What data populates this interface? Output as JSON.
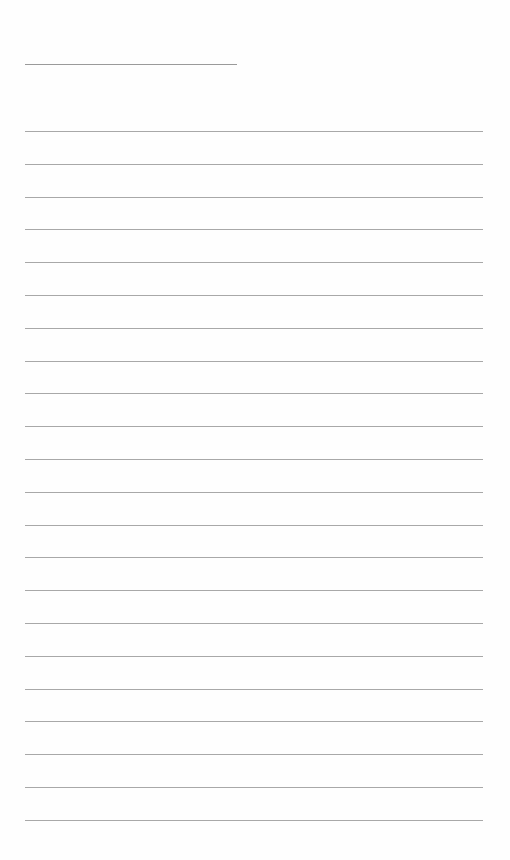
{
  "document": {
    "type": "lined-paper",
    "title_line": {
      "present": true,
      "text": ""
    },
    "ruled_lines": {
      "count": 22,
      "start_y": 131,
      "spacing": 32.8,
      "left": 25,
      "right": 483,
      "color": "#a8a8a8"
    },
    "content": []
  }
}
